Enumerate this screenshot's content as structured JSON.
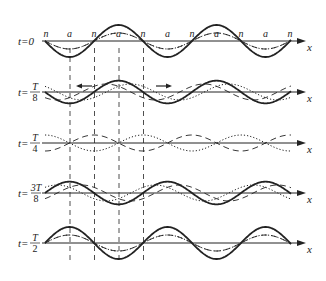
{
  "figure": {
    "axis_label": "x",
    "node_label": "n",
    "antinode_label": "a",
    "top_row_point_labels": [
      "n",
      "a",
      "n",
      "a",
      "n",
      "a",
      "n",
      "a",
      "n",
      "a",
      "n"
    ],
    "rows": [
      {
        "id": "t0",
        "prefix": "t=",
        "value": "0",
        "fraction": false
      },
      {
        "id": "t1",
        "prefix": "t=",
        "numerator": "T",
        "denominator": "8",
        "fraction": true
      },
      {
        "id": "t2",
        "prefix": "t=",
        "numerator": "T",
        "denominator": "4",
        "fraction": true
      },
      {
        "id": "t3",
        "prefix": "t=",
        "numerator": "3T",
        "denominator": "8",
        "fraction": true
      },
      {
        "id": "t4",
        "prefix": "t=",
        "numerator": "T",
        "denominator": "2",
        "fraction": true
      }
    ],
    "legend_styles": {
      "resultant": "solid thick",
      "wave_right": "dotted",
      "wave_left": "dashed"
    },
    "colors": {
      "ink": "#222222",
      "background": "#ffffff"
    }
  }
}
